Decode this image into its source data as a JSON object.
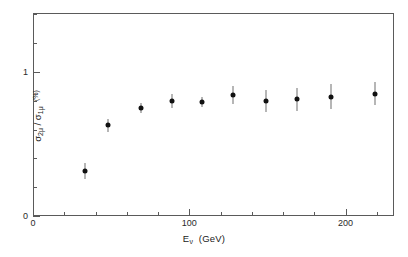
{
  "figure": {
    "background_color": "#ffffff",
    "axis_color": "#5a5a5a",
    "marker_color": "#111111",
    "errorbar_color": "#6e6e6e"
  },
  "axes": {
    "x": {
      "label_prefix": "E",
      "label_subscript": "ν",
      "label_unit": "(GeV)",
      "label_full": "Eν (GeV)",
      "ticklabels": [
        "0",
        "100",
        "200"
      ],
      "tickvalues": [
        0,
        100,
        200
      ],
      "minor_step": 20,
      "range": [
        0,
        231
      ]
    },
    "y": {
      "label_full": "σ2μ / σ1μ  (%)",
      "numerator": "σ",
      "numerator_sub": "2μ",
      "denominator": "σ",
      "denominator_sub": "1μ",
      "unit": "(%)",
      "ticklabels": [
        "0",
        "1"
      ],
      "tickvalues": [
        0,
        1
      ],
      "minor_step": 0.2,
      "range": [
        0,
        1.41
      ]
    }
  },
  "chart_data": {
    "type": "scatter",
    "title": "",
    "xlabel": "Eν (GeV)",
    "ylabel": "σ2μ / σ1μ (%)",
    "xlim": [
      0,
      231
    ],
    "ylim": [
      0,
      1.41
    ],
    "grid": false,
    "legend": null,
    "series": [
      {
        "name": "σ2μ/σ1μ",
        "marker": "filled-circle",
        "x": [
          33,
          48,
          69,
          89,
          108,
          128,
          149,
          169,
          191,
          219
        ],
        "y": [
          0.31,
          0.63,
          0.75,
          0.8,
          0.79,
          0.84,
          0.8,
          0.81,
          0.83,
          0.85
        ],
        "yerr": [
          0.055,
          0.045,
          0.035,
          0.05,
          0.035,
          0.06,
          0.075,
          0.08,
          0.085,
          0.08
        ]
      }
    ]
  }
}
